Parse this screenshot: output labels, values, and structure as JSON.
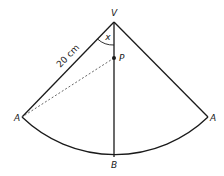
{
  "diagram": {
    "type": "sector / cone net",
    "labels": {
      "vertex": "V",
      "point_p": "P",
      "angle": "x",
      "left_corner": "A",
      "right_corner": "A",
      "bottom": "B",
      "side_length": "20 cm"
    },
    "colors": {
      "stroke": "#1a1a1a",
      "dashed": "#555555",
      "background": "#ffffff"
    }
  }
}
